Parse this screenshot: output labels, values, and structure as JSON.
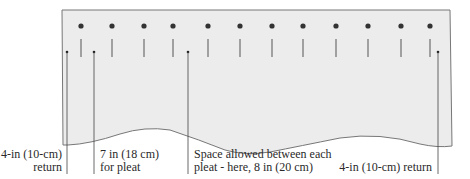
{
  "diagram": {
    "panel": {
      "fill": "#ececec",
      "stroke": "#777777"
    },
    "pin_color": "#333333",
    "pins_x": [
      81,
      112,
      144,
      173,
      208,
      240,
      272,
      303,
      336,
      368,
      401,
      430
    ],
    "leaders_x": [
      67,
      94,
      188,
      438
    ]
  },
  "labels": {
    "return_left_line1": "4-in (10-cm)",
    "return_left_line2": "return",
    "pleat_line1": "7 in (18 cm)",
    "pleat_line2": "for pleat",
    "space_line1": "Space allowed between each",
    "space_line2": "pleat - here, 8 in (20 cm)",
    "return_right": "4-in (10-cm) return"
  }
}
